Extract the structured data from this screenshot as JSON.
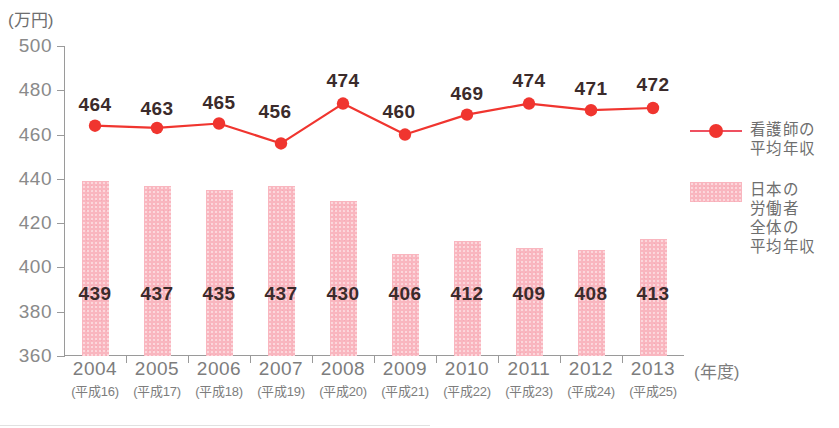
{
  "axis": {
    "y_unit_label": "(万円)",
    "x_unit_label": "(年度)",
    "y_ticks": [
      360,
      380,
      400,
      420,
      440,
      460,
      480,
      500
    ],
    "y_min": 360,
    "y_max": 500
  },
  "legend": {
    "line_entry": {
      "name": "看護師の平均年収",
      "text": "看護師の\n平均年収",
      "color": "#f0352f"
    },
    "bar_entry": {
      "name": "日本の労働者全体の平均年収",
      "text": "日本の\n労働者\n全体の\n平均年収",
      "color": "#f9b6bf"
    }
  },
  "chart_data": {
    "type": "bar",
    "title": "",
    "subtitle": "",
    "xlabel": "(年度)",
    "ylabel": "(万円)",
    "ylim": [
      360,
      500
    ],
    "ytick_step": 20,
    "grid": false,
    "legend_position": "right",
    "categories": [
      "2004",
      "2005",
      "2006",
      "2007",
      "2008",
      "2009",
      "2010",
      "2011",
      "2012",
      "2013"
    ],
    "category_sublabels": [
      "(平成16)",
      "(平成17)",
      "(平成18)",
      "(平成19)",
      "(平成20)",
      "(平成21)",
      "(平成22)",
      "(平成23)",
      "(平成24)",
      "(平成25)"
    ],
    "series": [
      {
        "name": "日本の労働者全体の平均年収",
        "type": "bar",
        "color": "#f9b6bf",
        "values": [
          439,
          437,
          435,
          437,
          430,
          406,
          412,
          409,
          408,
          413
        ]
      },
      {
        "name": "看護師の平均年収",
        "type": "line",
        "color": "#f0352f",
        "values": [
          464,
          463,
          465,
          456,
          474,
          460,
          469,
          474,
          471,
          472
        ]
      }
    ]
  }
}
